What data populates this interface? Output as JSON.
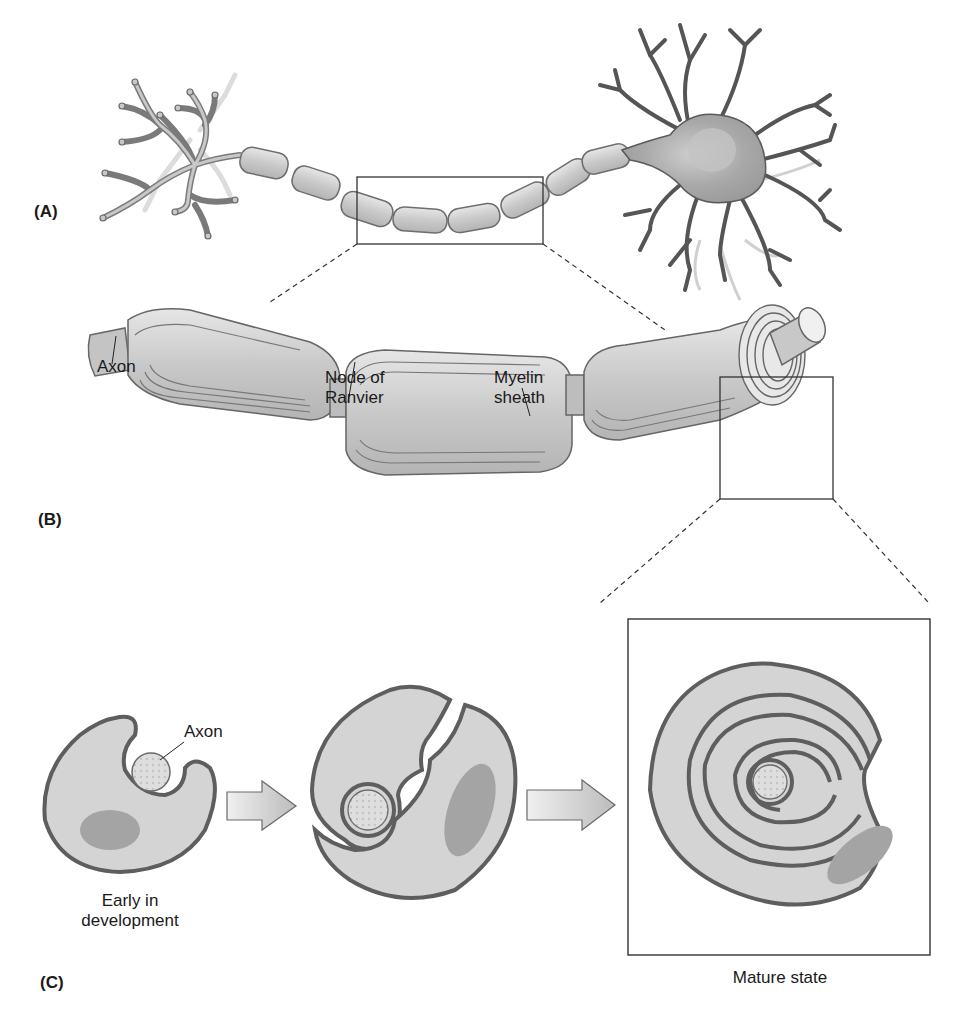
{
  "figure": {
    "panels": [
      {
        "id": "A",
        "label": "(A)",
        "description": "Whole neuron with myelinated axon"
      },
      {
        "id": "B",
        "label": "(B)",
        "description": "Enlarged view of myelinated axon segment"
      },
      {
        "id": "C",
        "label": "(C)",
        "description": "Cross-section stages of myelin wrapping"
      }
    ],
    "labels_b": {
      "axon": "Axon",
      "node_line1": "Node of",
      "node_line2": "Ranvier",
      "myelin_line1": "Myelin",
      "myelin_line2": "sheath"
    },
    "labels_c": {
      "axon": "Axon",
      "early_line1": "Early in",
      "early_line2": "development",
      "mature": "Mature state"
    },
    "colors": {
      "outline": "#555555",
      "fill_light": "#d6d6d6",
      "fill_mid": "#bdbdbd",
      "nucleus": "#9a9a9a",
      "background": "#ffffff"
    }
  }
}
